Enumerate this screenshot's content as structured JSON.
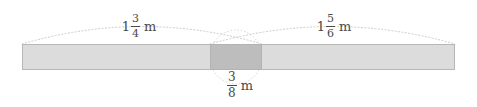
{
  "diagram": {
    "kind": "fraction-overlap-bar-diagram",
    "canvas": {
      "width": 477,
      "height": 107,
      "background": "#ffffff"
    },
    "bar": {
      "x": 22,
      "y": 44,
      "width": 433,
      "height": 26,
      "fill": "#dcdcdc",
      "stroke": "#b4b4b4"
    },
    "overlap_segment": {
      "x": 210,
      "y": 44,
      "width": 52,
      "height": 26,
      "fill": "#bdbdbd",
      "stroke": "#b0b0b0"
    },
    "guides": {
      "color": "#c9c9c9",
      "dash": "1,2",
      "left_arc": {
        "x1": 22,
        "y1": 44,
        "cx": 142,
        "cy": 9,
        "x2": 262,
        "y2": 44
      },
      "right_arc": {
        "x1": 210,
        "y1": 44,
        "cx": 332,
        "cy": 9,
        "x2": 455,
        "y2": 44
      },
      "middle_ellipse": {
        "cx": 236,
        "cy": 57,
        "rx": 26,
        "ry": 27
      }
    },
    "labels": {
      "left": {
        "name": "left-measure-label",
        "whole": "1",
        "numerator": "3",
        "denominator": "4",
        "unit": "m",
        "text": "1 3/4 m"
      },
      "right": {
        "name": "right-measure-label",
        "whole": "1",
        "numerator": "5",
        "denominator": "6",
        "unit": "m",
        "text": "1 5/6 m"
      },
      "middle": {
        "name": "overlap-measure-label",
        "whole": "",
        "numerator": "3",
        "denominator": "8",
        "unit": "m",
        "text": "3/8 m"
      }
    }
  }
}
